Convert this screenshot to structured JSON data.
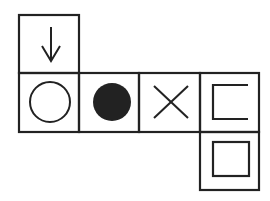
{
  "diagram": {
    "type": "cube-net",
    "stroke_color": "#222222",
    "fill_color": "#222222",
    "background": "#ffffff",
    "faces": [
      {
        "id": "top",
        "symbol": "down-arrow",
        "glyph": "↓"
      },
      {
        "id": "row-1",
        "symbol": "open-circle",
        "glyph": "○"
      },
      {
        "id": "row-2",
        "symbol": "filled-circle",
        "glyph": "●"
      },
      {
        "id": "row-3",
        "symbol": "x-cross",
        "glyph": "✕"
      },
      {
        "id": "row-4",
        "symbol": "open-bracket-square",
        "glyph": "⊏"
      },
      {
        "id": "bottom",
        "symbol": "square",
        "glyph": "□"
      }
    ]
  }
}
